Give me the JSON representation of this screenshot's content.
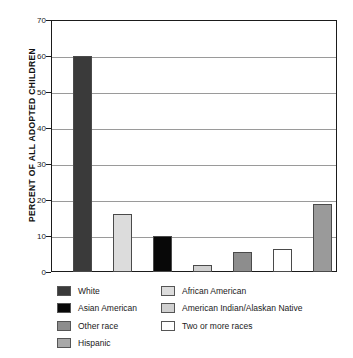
{
  "chart_data": {
    "type": "bar",
    "title": "",
    "xlabel": "",
    "ylabel": "PERCENT OF ALL ADOPTED CHILDREN",
    "ylim": [
      0,
      70
    ],
    "ytick_step": 10,
    "yticks": [
      0,
      10,
      20,
      30,
      40,
      50,
      60,
      70
    ],
    "grid": true,
    "legend_position": "below",
    "categories": [
      "White",
      "African American",
      "Asian American",
      "Hispanic",
      "Other race",
      "Two or more races",
      "American Indian/Alaskan Native"
    ],
    "values": [
      60,
      16,
      10,
      2,
      5.5,
      6.5,
      19
    ],
    "colors": [
      "#3a3a3a",
      "#dcdcdc",
      "#080808",
      "#d0d0d0",
      "#8d8d8d",
      "#ffffff",
      "#9a9a9a"
    ]
  },
  "axis": {
    "tick_labels": [
      "70",
      "60",
      "50",
      "40",
      "30",
      "20",
      "10",
      "0"
    ]
  },
  "legend": {
    "left_column": [
      {
        "label": "White",
        "color": "#3a3a3a"
      },
      {
        "label": "Asian American",
        "color": "#080808"
      },
      {
        "label": "Other race",
        "color": "#8d8d8d"
      },
      {
        "label": "Hispanic",
        "color": "#a8a8a8"
      }
    ],
    "right_column": [
      {
        "label": "African American",
        "color": "#dcdcdc"
      },
      {
        "label": "American Indian/Alaskan Native",
        "color": "#d0d0d0"
      },
      {
        "label": "Two or more races",
        "color": "#ffffff"
      }
    ]
  }
}
